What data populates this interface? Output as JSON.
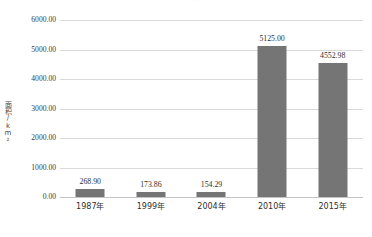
{
  "chart_data": {
    "type": "bar",
    "title": "图    各期湿地总面积变化统计图",
    "title_note": "title is cropped by the top edge of the screenshot and is illegible",
    "xlabel": "",
    "ylabel": "面积/km²",
    "categories": [
      "1987年",
      "1999年",
      "2004年",
      "2010年",
      "2015年"
    ],
    "values": [
      268.9,
      173.86,
      154.29,
      5125.0,
      4552.98
    ],
    "value_labels": [
      "268.90",
      "173.86",
      "154.29",
      "5125.00",
      "4552.98"
    ],
    "ylim": [
      0,
      6000
    ],
    "ytick_step": 1000,
    "yticks": [
      6000,
      5000,
      4000,
      3000,
      2000,
      1000,
      0
    ],
    "ytick_labels": [
      "6000.00",
      "5000.00",
      "4000.00",
      "3000.00",
      "2000.00",
      "1000.00",
      "0.00"
    ],
    "grid": "horizontal",
    "legend": "none",
    "series_color": "#757575",
    "gridline_color": "#d9d9d9",
    "background_color": "#ffffff"
  }
}
